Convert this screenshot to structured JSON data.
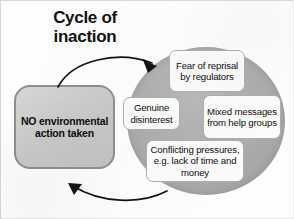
{
  "diagram": {
    "title_line1": "Cycle of",
    "title_line2": "inaction",
    "action_box": {
      "label": "NO environmental action taken",
      "fill_color": "#c9c9c9",
      "border_color": "#8e8e8e"
    },
    "circle": {
      "fill_color": "#ababab"
    },
    "factors": [
      {
        "id": "fear-of-reprisal",
        "label": "Fear of reprisal by regulators"
      },
      {
        "id": "genuine-disinterest",
        "label": "Genuine disinterest"
      },
      {
        "id": "mixed-messages",
        "label": "Mixed messages from help groups"
      },
      {
        "id": "conflicting-pressures",
        "label": "Conflicting pressures, e.g. lack of time and money"
      }
    ],
    "arrows": [
      {
        "id": "arrow-box-to-circle",
        "from": "action-box",
        "to": "cycle-circle",
        "color": "#111111"
      },
      {
        "id": "arrow-circle-to-box",
        "from": "cycle-circle",
        "to": "action-box",
        "color": "#111111"
      }
    ]
  }
}
